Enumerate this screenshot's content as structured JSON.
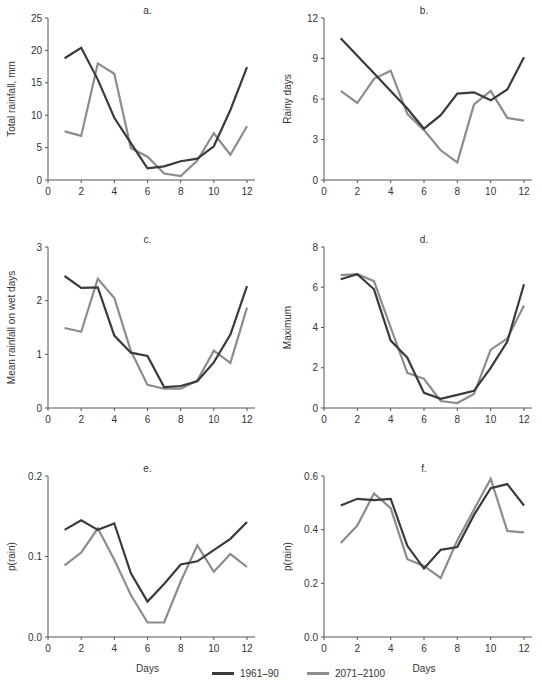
{
  "colors": {
    "s1961": "#3a3a3a",
    "s2071": "#8c8c8c",
    "axis": "#555555"
  },
  "legend": [
    {
      "label": "1961–90",
      "color": "#3a3a3a"
    },
    {
      "label": "2071–2100",
      "color": "#8c8c8c"
    }
  ],
  "chart_data": [
    {
      "type": "line",
      "panel": "a.",
      "title": "a.",
      "xlabel": "",
      "ylabel": "Total rainfall, mm",
      "xlim": [
        0,
        12
      ],
      "ylim": [
        0,
        25
      ],
      "xticks": [
        0,
        2,
        4,
        6,
        8,
        10,
        12
      ],
      "yticks": [
        0,
        5,
        10,
        15,
        20,
        25
      ],
      "x": [
        1,
        2,
        3,
        4,
        5,
        6,
        7,
        8,
        9,
        10,
        11,
        12
      ],
      "series": [
        {
          "name": "1961–90",
          "values": [
            18.8,
            20.4,
            15.5,
            9.6,
            5.7,
            1.8,
            2.1,
            2.9,
            3.3,
            5.2,
            10.8,
            17.4
          ]
        },
        {
          "name": "2071–2100",
          "values": [
            7.5,
            6.8,
            18.0,
            16.4,
            4.9,
            3.6,
            1.0,
            0.6,
            3.0,
            7.2,
            3.9,
            8.3
          ]
        }
      ]
    },
    {
      "type": "line",
      "panel": "b.",
      "title": "b.",
      "xlabel": "",
      "ylabel": "Rainy days",
      "xlim": [
        0,
        12
      ],
      "ylim": [
        0,
        12
      ],
      "xticks": [
        0,
        2,
        4,
        6,
        8,
        10,
        12
      ],
      "yticks": [
        0,
        3,
        6,
        9,
        12
      ],
      "x": [
        1,
        2,
        3,
        4,
        5,
        6,
        7,
        8,
        9,
        10,
        11,
        12
      ],
      "series": [
        {
          "name": "1961–90",
          "values": [
            10.5,
            9.2,
            7.9,
            6.6,
            5.3,
            3.8,
            4.8,
            6.4,
            6.5,
            5.9,
            6.7,
            9.1
          ]
        },
        {
          "name": "2071–2100",
          "values": [
            6.6,
            5.7,
            7.5,
            8.1,
            4.9,
            3.7,
            2.2,
            1.3,
            5.6,
            6.6,
            4.6,
            4.4
          ]
        }
      ]
    },
    {
      "type": "line",
      "panel": "c.",
      "title": "c.",
      "xlabel": "",
      "ylabel": "Mean rainfall on wet days",
      "xlim": [
        0,
        12
      ],
      "ylim": [
        0,
        3
      ],
      "xticks": [
        0,
        2,
        4,
        6,
        8,
        10,
        12
      ],
      "yticks": [
        0,
        1,
        2,
        3
      ],
      "x": [
        1,
        2,
        3,
        4,
        5,
        6,
        7,
        8,
        9,
        10,
        11,
        12
      ],
      "series": [
        {
          "name": "1961–90",
          "values": [
            2.46,
            2.24,
            2.25,
            1.35,
            1.03,
            0.97,
            0.39,
            0.41,
            0.5,
            0.85,
            1.37,
            2.27
          ]
        },
        {
          "name": "2071–2100",
          "values": [
            1.49,
            1.42,
            2.41,
            2.05,
            1.06,
            0.43,
            0.36,
            0.36,
            0.51,
            1.07,
            0.84,
            1.87
          ]
        }
      ]
    },
    {
      "type": "line",
      "panel": "d.",
      "title": "d.",
      "xlabel": "",
      "ylabel": "Maximum",
      "xlim": [
        0,
        12
      ],
      "ylim": [
        0,
        8
      ],
      "xticks": [
        0,
        2,
        4,
        6,
        8,
        10,
        12
      ],
      "yticks": [
        0,
        2,
        4,
        6,
        8
      ],
      "x": [
        1,
        2,
        3,
        4,
        5,
        6,
        7,
        8,
        9,
        10,
        11,
        12
      ],
      "series": [
        {
          "name": "1961–90",
          "values": [
            6.4,
            6.65,
            5.9,
            3.35,
            2.5,
            0.75,
            0.45,
            0.65,
            0.85,
            2.0,
            3.3,
            6.15
          ]
        },
        {
          "name": "2071–2100",
          "values": [
            6.6,
            6.65,
            6.3,
            4.0,
            1.75,
            1.45,
            0.35,
            0.25,
            0.7,
            2.9,
            3.45,
            5.1
          ]
        }
      ]
    },
    {
      "type": "line",
      "panel": "e.",
      "title": "e.",
      "xlabel": "Days",
      "ylabel": "p(rain)",
      "xlim": [
        0,
        12
      ],
      "ylim": [
        0.0,
        0.2
      ],
      "xticks": [
        0,
        2,
        4,
        6,
        8,
        10,
        12
      ],
      "yticks": [
        0.0,
        0.1,
        0.2
      ],
      "x": [
        1,
        2,
        3,
        4,
        5,
        6,
        7,
        8,
        9,
        10,
        11,
        12
      ],
      "series": [
        {
          "name": "1961–90",
          "values": [
            0.133,
            0.145,
            0.133,
            0.141,
            0.079,
            0.044,
            0.066,
            0.09,
            0.094,
            0.108,
            0.122,
            0.143
          ]
        },
        {
          "name": "2071–2100",
          "values": [
            0.089,
            0.105,
            0.135,
            0.096,
            0.052,
            0.018,
            0.018,
            0.069,
            0.114,
            0.081,
            0.103,
            0.087
          ]
        }
      ]
    },
    {
      "type": "line",
      "panel": "f.",
      "title": "f.",
      "xlabel": "Days",
      "ylabel": "p(rain)",
      "xlim": [
        0,
        12
      ],
      "ylim": [
        0.0,
        0.6
      ],
      "xticks": [
        0,
        2,
        4,
        6,
        8,
        10,
        12
      ],
      "yticks": [
        0.0,
        0.2,
        0.4,
        0.6
      ],
      "x": [
        1,
        2,
        3,
        4,
        5,
        6,
        7,
        8,
        9,
        10,
        11,
        12
      ],
      "series": [
        {
          "name": "1961–90",
          "values": [
            0.49,
            0.515,
            0.51,
            0.515,
            0.34,
            0.255,
            0.325,
            0.335,
            0.455,
            0.555,
            0.57,
            0.49
          ]
        },
        {
          "name": "2071–2100",
          "values": [
            0.35,
            0.415,
            0.535,
            0.48,
            0.29,
            0.265,
            0.22,
            0.36,
            0.475,
            0.59,
            0.395,
            0.39
          ]
        }
      ]
    }
  ]
}
